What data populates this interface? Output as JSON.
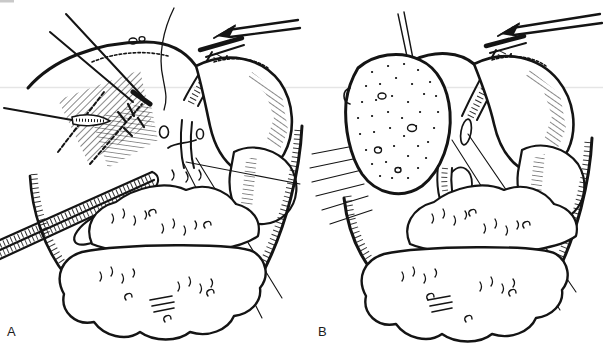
{
  "figure": {
    "background_color": "#ffffff",
    "ink_color": "#141414",
    "panel_a": {
      "label": "A"
    },
    "panel_b": {
      "label": "B"
    },
    "panel_a_elements": [
      "needle-retractors-icon",
      "retracted-liver-lobe",
      "liver-dome-edge",
      "suture-thread",
      "vascular-clamp-icon",
      "right-liver-lobe",
      "duodenum-lobe",
      "porta-hepatis-vessels",
      "ribbon-retractor-icon",
      "grasping-forceps-icon",
      "gallbladder-edge",
      "stomach-mass",
      "transverse-colon",
      "stay-suture-lines",
      "wound-edge"
    ],
    "panel_b_elements": [
      "stay-suture-loop",
      "cut-liver-surface-stippled",
      "liver-dome-edge",
      "vascular-clamp-icon",
      "right-liver-lobe",
      "duodenum-lobe",
      "porta-hepatis-vessels",
      "vessel-stump",
      "stomach-mass",
      "transverse-colon",
      "stay-suture-lines",
      "wound-edge",
      "retraction-motion-lines"
    ]
  }
}
